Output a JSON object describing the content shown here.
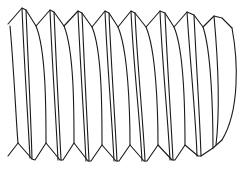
{
  "image": {
    "subject": "Line drawing of a threaded screw shank (side view)",
    "background": "#ffffff",
    "stroke_color": "#1a1a1a",
    "thread_count": 8
  }
}
